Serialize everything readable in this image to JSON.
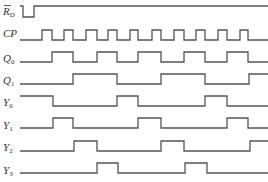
{
  "diagram": {
    "stroke_color": "#555555",
    "label_color": "#333333",
    "background": "#ffffff",
    "x_range": [
      20,
      268
    ],
    "signals": [
      {
        "id": "rd",
        "label_main": "R",
        "label_sub": "D",
        "overbar": true,
        "label_y": 15,
        "high_y": 6,
        "low_y": 17,
        "initial": 1,
        "edges": [
          23,
          34
        ]
      },
      {
        "id": "cp",
        "label_main": "CP",
        "label_sub": "",
        "overbar": false,
        "label_y": 37,
        "high_y": 30,
        "low_y": 40,
        "initial": 0,
        "edges": [
          42,
          52,
          64,
          73,
          86,
          97,
          108,
          117,
          130,
          138,
          152,
          161,
          174,
          184,
          196,
          205,
          218,
          227,
          240,
          248
        ]
      },
      {
        "id": "q0",
        "label_main": "Q",
        "label_sub": "0",
        "overbar": false,
        "label_y": 62,
        "high_y": 52,
        "low_y": 62,
        "initial": 0,
        "edges": [
          52,
          73,
          97,
          117,
          138,
          161,
          184,
          205,
          227,
          248
        ]
      },
      {
        "id": "q1",
        "label_main": "Q",
        "label_sub": "1",
        "overbar": false,
        "label_y": 84,
        "high_y": 74,
        "low_y": 84,
        "initial": 0,
        "edges": [
          73,
          117,
          161,
          205,
          249
        ]
      },
      {
        "id": "y0",
        "label_main": "Y",
        "label_sub": "0",
        "overbar": false,
        "label_y": 106,
        "high_y": 96,
        "low_y": 106,
        "initial": 1,
        "edges": [
          53,
          117,
          138,
          205,
          227
        ]
      },
      {
        "id": "y1",
        "label_main": "Y",
        "label_sub": "1",
        "overbar": false,
        "label_y": 129,
        "high_y": 118,
        "low_y": 128,
        "initial": 0,
        "edges": [
          53,
          73,
          138,
          161,
          227,
          248
        ]
      },
      {
        "id": "y2",
        "label_main": "Y",
        "label_sub": "2",
        "overbar": false,
        "label_y": 151,
        "high_y": 141,
        "low_y": 151,
        "initial": 0,
        "edges": [
          74,
          97,
          161,
          184,
          250
        ]
      },
      {
        "id": "y3",
        "label_main": "Y",
        "label_sub": "3",
        "overbar": false,
        "label_y": 174,
        "high_y": 163,
        "low_y": 173,
        "initial": 0,
        "edges": [
          97,
          118,
          185,
          207
        ]
      }
    ]
  }
}
